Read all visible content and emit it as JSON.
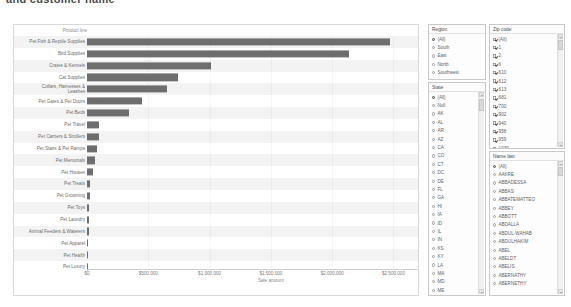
{
  "top_heading": "and customer name",
  "chart_data": {
    "type": "bar",
    "orientation": "horizontal",
    "title": "",
    "xlabel": "Sale amount",
    "ylabel": "Product line",
    "xlim": [
      0,
      2700000
    ],
    "grid": true,
    "xticks": [
      "$0",
      "$500,000",
      "$1,000,000",
      "$1,500,000",
      "$2,000,000",
      "$2,500,000"
    ],
    "xtick_values": [
      0,
      500000,
      1000000,
      1500000,
      2000000,
      2500000
    ],
    "categories": [
      "Pet Fish & Reptile Supplies",
      "Bird Supplies",
      "Crates & Kennels",
      "Cat Supplies",
      "Collars, Harnesses &\nLeashes",
      "Pet Gates & Pet Doors",
      "Pet Beds",
      "Pet Travel",
      "Pet Carriers & Strollers",
      "Pet Stairs & Pet Ramps",
      "Pet Memorials",
      "Pet Houses",
      "Pet Treats",
      "Pet Grooming",
      "Pet Toys",
      "Pet Laundry",
      "Animal Feeders & Waterers",
      "Pet Apparel",
      "Pet Health",
      "Pet Luxury"
    ],
    "values": [
      2470000,
      2140000,
      1010000,
      740000,
      650000,
      450000,
      340000,
      100000,
      95000,
      80000,
      65000,
      52000,
      25000,
      22000,
      18000,
      15000,
      13000,
      11000,
      9000,
      7000
    ],
    "bar_color": "#6e6e6e"
  },
  "filters": {
    "region": {
      "title": "Region",
      "type": "radio",
      "selected": "(All)",
      "items": [
        "(All)",
        "South",
        "East",
        "North",
        "Southwest",
        "West"
      ]
    },
    "state": {
      "title": "State",
      "type": "radio",
      "selected": "(All)",
      "items": [
        "(All)",
        "Null",
        "AK",
        "AL",
        "AR",
        "AZ",
        "CA",
        "CO",
        "CT",
        "DC",
        "DE",
        "FL",
        "GA",
        "HI",
        "IA",
        "ID",
        "IL",
        "IN",
        "KS",
        "KY",
        "LA",
        "MA",
        "MD",
        "ME"
      ]
    },
    "zip_code": {
      "title": "Zip code",
      "type": "checkbox",
      "items": [
        {
          "label": "(All)",
          "checked": true
        },
        {
          "label": "1",
          "checked": true
        },
        {
          "label": "2",
          "checked": true
        },
        {
          "label": "6",
          "checked": true
        },
        {
          "label": "610",
          "checked": true
        },
        {
          "label": "612",
          "checked": true
        },
        {
          "label": "613",
          "checked": true
        },
        {
          "label": "681",
          "checked": true
        },
        {
          "label": "700",
          "checked": true
        },
        {
          "label": "902",
          "checked": true
        },
        {
          "label": "940",
          "checked": true
        },
        {
          "label": "958",
          "checked": true
        },
        {
          "label": "959",
          "checked": true
        },
        {
          "label": "1030",
          "checked": true
        },
        {
          "label": "1022",
          "checked": true
        }
      ]
    },
    "name_last": {
      "title": "Name last",
      "type": "radio",
      "selected": "(All)",
      "items": [
        "(All)",
        "AAKRE",
        "ABBADESSA",
        "ABBAS",
        "ABBATEMATTEO",
        "ABBEY",
        "ABBOTT",
        "ABDALLA",
        "ABDUL-WAHAB",
        "ABDULHAKIM",
        "ABEL",
        "ABELDT",
        "ABELIS",
        "ABERNATHY",
        "ABERNETHY"
      ]
    }
  }
}
